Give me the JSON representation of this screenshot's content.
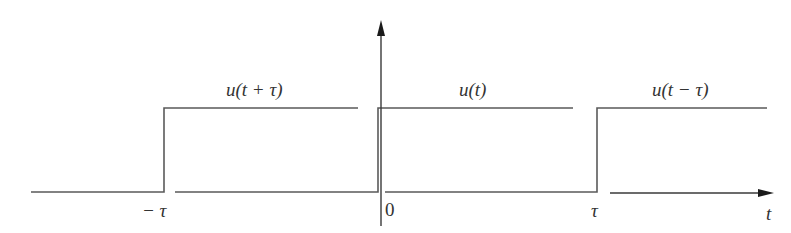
{
  "figure": {
    "title": "",
    "signals": [
      {
        "label": "u(t + τ)",
        "step_at": "−τ"
      },
      {
        "label": "u(t)",
        "step_at": "0"
      },
      {
        "label": "u(t − τ)",
        "step_at": "τ"
      }
    ],
    "ticks": {
      "minus_tau": "− τ",
      "zero": "0",
      "tau": "τ"
    },
    "axis": {
      "x_label": "t"
    },
    "colors": {
      "line": "#5a5a5a",
      "axis": "#3a3a3a",
      "text": "#333333",
      "background": "#ffffff"
    }
  }
}
